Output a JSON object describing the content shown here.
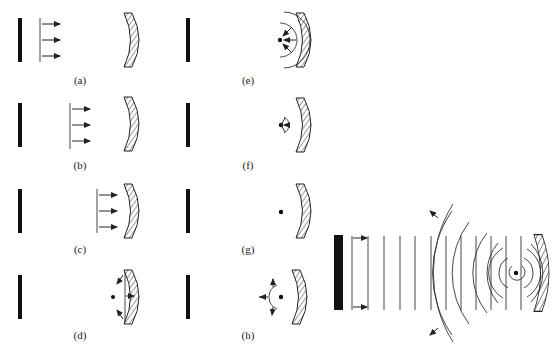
{
  "figure": {
    "panels": [
      {
        "id": "a",
        "label": "(a)",
        "description": "Plane wavefront with rightward arrows leaving the planar reflector toward the concave mirror"
      },
      {
        "id": "b",
        "label": "(b)",
        "description": "Plane wavefront travelling further right toward the concave mirror"
      },
      {
        "id": "c",
        "label": "(c)",
        "description": "Plane wavefront arriving at the concave mirror"
      },
      {
        "id": "d",
        "label": "(d)",
        "description": "Wavefront reflecting from concave mirror, edges curving back toward focus"
      },
      {
        "id": "e",
        "label": "(e)",
        "description": "Converging curved wavefront heading toward the focal point"
      },
      {
        "id": "f",
        "label": "(f)",
        "description": "Small wavefront converging at the focal point"
      },
      {
        "id": "g",
        "label": "(g)",
        "description": "Wave collapsed at focal point (dot only)"
      },
      {
        "id": "h",
        "label": "(h)",
        "description": "Diverging wavefront emanating from focal point toward the left"
      }
    ],
    "composite": {
      "description": "Superposition of plane waves from planar reflector and circular waves from focal point of concave mirror",
      "plane_wave_count": 13,
      "circular_wave_count": 8
    }
  },
  "colors": {
    "ink": "#222222",
    "background": "#ffffff"
  }
}
